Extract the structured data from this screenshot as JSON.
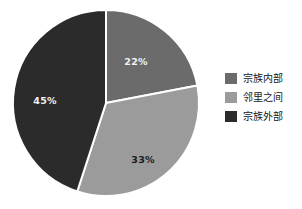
{
  "chart_data": {
    "type": "pie",
    "title": "",
    "categories": [
      "宗族内部",
      "邻里之间",
      "宗族外部"
    ],
    "values": [
      22,
      33,
      45
    ],
    "value_labels": [
      "22%",
      "33%",
      "45%"
    ],
    "colors": [
      "#6b6b6b",
      "#9b9b9b",
      "#2b2b2b"
    ],
    "label_text_colors": [
      "#f2f2f2",
      "#1b1b1b",
      "#f2f2f2"
    ],
    "start_angle_deg": 0,
    "direction": "clockwise",
    "separator_color": "#ffffff",
    "legend_position": "right",
    "grid": false,
    "xlabel": "",
    "ylabel": "",
    "slices": [
      {
        "label": "宗族内部",
        "value": 22,
        "display": "22%",
        "color": "#6b6b6b",
        "label_x": 136,
        "label_y": 62,
        "label_fill": "#f2f2f2"
      },
      {
        "label": "邻里之间",
        "value": 33,
        "display": "33%",
        "color": "#9b9b9b",
        "label_x": 143,
        "label_y": 160,
        "label_fill": "#1b1b1b"
      },
      {
        "label": "宗族外部",
        "value": 45,
        "display": "45%",
        "color": "#2b2b2b",
        "label_x": 45,
        "label_y": 101,
        "label_fill": "#f2f2f2"
      }
    ]
  },
  "legend": {
    "items": [
      {
        "label": "宗族内部",
        "color": "#6b6b6b"
      },
      {
        "label": "邻里之间",
        "color": "#9b9b9b"
      },
      {
        "label": "宗族外部",
        "color": "#2b2b2b"
      }
    ]
  },
  "geometry": {
    "center_x": 106,
    "center_y": 103,
    "radius": 93
  }
}
